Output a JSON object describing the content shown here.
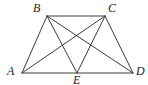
{
  "figure": {
    "background_color": "#ffffff",
    "stroke_color": "#3c3c3c",
    "label_color": "#1c1c1c",
    "stroke_width": 1,
    "width": 148,
    "height": 85,
    "points": {
      "A": {
        "label": "A",
        "x": 22,
        "y": 73,
        "label_x": 7,
        "label_y": 65
      },
      "B": {
        "label": "B",
        "x": 47,
        "y": 16,
        "label_x": 33,
        "label_y": 2
      },
      "C": {
        "label": "C",
        "x": 105,
        "y": 16,
        "label_x": 108,
        "label_y": 2
      },
      "D": {
        "label": "D",
        "x": 133,
        "y": 73,
        "label_x": 136,
        "label_y": 65
      },
      "E": {
        "label": "E",
        "x": 77,
        "y": 73,
        "label_x": 73,
        "label_y": 74
      }
    },
    "segments": [
      {
        "name": "segment-AB",
        "from": "A",
        "to": "B"
      },
      {
        "name": "segment-BC",
        "from": "B",
        "to": "C"
      },
      {
        "name": "segment-CD",
        "from": "C",
        "to": "D"
      },
      {
        "name": "segment-AD",
        "from": "A",
        "to": "D"
      },
      {
        "name": "segment-AC",
        "from": "A",
        "to": "C"
      },
      {
        "name": "segment-BD",
        "from": "B",
        "to": "D"
      },
      {
        "name": "segment-BE",
        "from": "B",
        "to": "E"
      },
      {
        "name": "segment-CE",
        "from": "C",
        "to": "E"
      }
    ]
  }
}
